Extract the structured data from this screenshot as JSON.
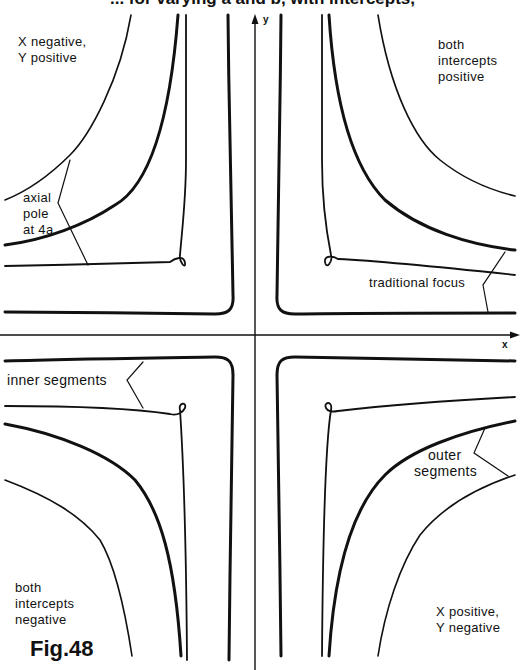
{
  "figure": {
    "title": "... for varying a and b, with intercepts,",
    "number": "Fig.48",
    "axes": {
      "x_label": "x",
      "y_label": "y"
    },
    "quadrant_labels": {
      "top_left": [
        "X negative,",
        "Y positive"
      ],
      "top_right": [
        "both",
        "intercepts",
        "positive"
      ],
      "bottom_left": [
        "both",
        "intercepts",
        "negative"
      ],
      "bottom_right": [
        "X positive,",
        "Y negative"
      ]
    },
    "annotations": {
      "axial_pole": [
        "axial",
        "pole",
        "at 4a"
      ],
      "traditional_focus": "traditional focus",
      "inner_segments": "inner segments",
      "outer_segments": [
        "outer",
        "segments"
      ]
    }
  },
  "colors": {
    "ink": "#111111",
    "background": "#ffffff"
  }
}
